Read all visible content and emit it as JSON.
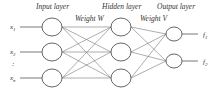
{
  "diagram": {
    "type": "neural-network",
    "layers": [
      {
        "name": "Input layer",
        "label_x": 36,
        "label_y": 8,
        "nodes": [
          {
            "label": "x1",
            "sub": "1",
            "cx": 52,
            "cy": 27
          },
          {
            "label": "x2",
            "sub": "2",
            "cx": 52,
            "cy": 52
          },
          {
            "label": "xn",
            "sub": "n",
            "cx": 52,
            "cy": 78
          }
        ]
      },
      {
        "name": "Hidden layer",
        "label_x": 102,
        "label_y": 8,
        "nodes": [
          {
            "cx": 121,
            "cy": 27
          },
          {
            "cx": 121,
            "cy": 52
          },
          {
            "cx": 121,
            "cy": 78
          }
        ]
      },
      {
        "name": "Output layer",
        "label_x": 157,
        "label_y": 8,
        "nodes": [
          {
            "label": "f1",
            "sub": "1",
            "cx": 174,
            "cy": 34
          },
          {
            "label": "f2",
            "sub": "2",
            "cx": 174,
            "cy": 61
          }
        ]
      }
    ],
    "weights": [
      {
        "name": "Weight W",
        "x": 75,
        "y": 20
      },
      {
        "name": "Weight V",
        "x": 141,
        "y": 20
      }
    ],
    "ellipsis": ":"
  },
  "labels": {
    "input_layer": "Input layer",
    "hidden_layer": "Hidden layer",
    "output_layer": "Output layer",
    "weight_w": "Weight W",
    "weight_v": "Weight V",
    "x1": "x",
    "x1_sub": "1",
    "x2": "x",
    "x2_sub": "2",
    "xn": "x",
    "xn_sub": "n",
    "f1": "f",
    "f1_sub": "1",
    "f2": "f",
    "f2_sub": "2"
  },
  "colors": {
    "stroke": "#555555",
    "edge": "#777777",
    "text": "#333333",
    "background": "#ffffff"
  }
}
